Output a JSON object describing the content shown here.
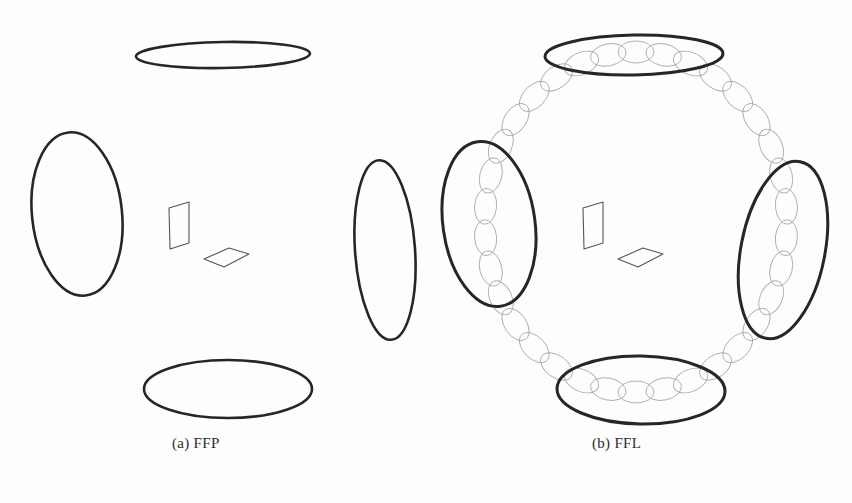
{
  "figure": {
    "kind": "scientific-line-diagram",
    "background_color": "#fdfdfd",
    "ink_color": "#262626",
    "faint_ink_color": "#9a9a9a",
    "outline_color": "#555555",
    "width": 852,
    "height": 503
  },
  "panels": [
    {
      "id": "a",
      "caption": "(a) FFP",
      "center": [
        223,
        228
      ],
      "description": "Field-Free Point configuration: four bold selection-field coil ellipses with two small parallelogram plates at the centre.",
      "coils": [
        {
          "name": "top-coil",
          "cx": 223,
          "cy": 55,
          "rx": 87,
          "ry": 13,
          "rot": -1,
          "stroke": 2.6
        },
        {
          "name": "bottom-coil",
          "cx": 228,
          "cy": 389,
          "rx": 84,
          "ry": 29,
          "rot": 0,
          "stroke": 2.6
        },
        {
          "name": "left-coil",
          "cx": 77,
          "cy": 214,
          "rx": 45,
          "ry": 82,
          "rot": -6,
          "stroke": 2.6
        },
        {
          "name": "right-coil",
          "cx": 385,
          "cy": 250,
          "rx": 30,
          "ry": 90,
          "rot": -4,
          "stroke": 2.6
        }
      ],
      "plates": [
        {
          "name": "vertical-plate",
          "points": "169,208 189,202 189,243 170,249"
        },
        {
          "name": "horizontal-plate",
          "points": "204,259 229,248 249,254 224,267"
        }
      ]
    },
    {
      "id": "b",
      "caption": "(b) FFL",
      "center": [
        634,
        228
      ],
      "description": "Field-Free Line configuration: the same four bold coil ellipses plus a chain of faint small ellipses tracing a ring through all four coils.",
      "coils": [
        {
          "name": "top-coil",
          "cx": 634,
          "cy": 55,
          "rx": 89,
          "ry": 20,
          "rot": -1,
          "stroke": 3.0
        },
        {
          "name": "bottom-coil",
          "cx": 641,
          "cy": 390,
          "rx": 84,
          "ry": 34,
          "rot": 1,
          "stroke": 3.0
        },
        {
          "name": "left-coil",
          "cx": 489,
          "cy": 224,
          "rx": 46,
          "ry": 83,
          "rot": -8,
          "stroke": 3.0
        },
        {
          "name": "right-coil",
          "cx": 783,
          "cy": 250,
          "rx": 42,
          "ry": 90,
          "rot": 11,
          "stroke": 3.0
        }
      ],
      "plates": [
        {
          "name": "vertical-plate",
          "points": "583,208 603,202 603,243 584,249"
        },
        {
          "name": "horizontal-plate",
          "points": "618,259 643,248 663,254 638,267"
        }
      ],
      "chain": {
        "name": "field-line-chain",
        "path_center": [
          636,
          222
        ],
        "path_rx": 151,
        "path_ry": 170,
        "link_count": 34,
        "link_rx": 18,
        "link_ry": 11,
        "stroke": 0.9,
        "color": "#9d9d9d"
      }
    }
  ]
}
